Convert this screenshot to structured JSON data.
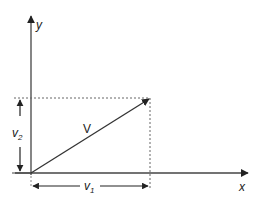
{
  "diagram": {
    "axes": {
      "x_label": "x",
      "y_label": "y"
    },
    "vector": {
      "label": "V",
      "from": [
        0,
        0
      ],
      "to": [
        1,
        1
      ]
    },
    "components": {
      "horizontal_label": "v",
      "horizontal_sub": "1",
      "vertical_label": "v",
      "vertical_sub": "2"
    },
    "colors": {
      "line": "#333333",
      "dashed": "#666666",
      "background": "#ffffff"
    }
  }
}
